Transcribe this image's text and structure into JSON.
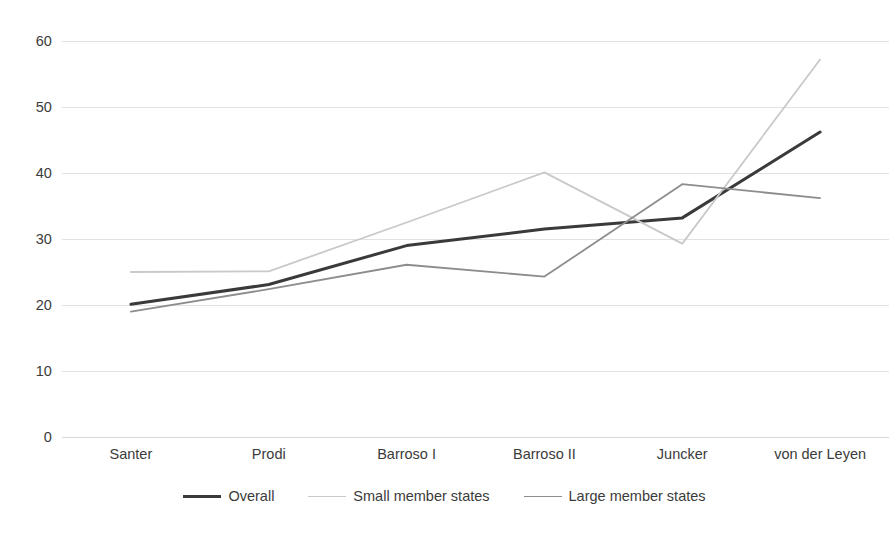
{
  "chart_data": {
    "type": "line",
    "title": "",
    "subtitle": "",
    "xlabel": "",
    "ylabel": "",
    "categories": [
      "Santer",
      "Prodi",
      "Barroso I",
      "Barroso II",
      "Juncker",
      "von der Leyen"
    ],
    "series": [
      {
        "name": "Overall",
        "color": "#3a3a3a",
        "width": 3.0,
        "values": [
          20.1,
          23.1,
          29.0,
          31.5,
          33.2,
          46.2
        ]
      },
      {
        "name": "Small member states",
        "color": "#c9c9c9",
        "width": 1.8,
        "values": [
          25.0,
          25.1,
          32.5,
          40.1,
          29.3,
          57.2
        ]
      },
      {
        "name": "Large member states",
        "color": "#8d8d8d",
        "width": 1.8,
        "values": [
          19.0,
          22.4,
          26.1,
          24.3,
          38.3,
          36.2
        ]
      }
    ],
    "ylim": [
      0,
      60
    ],
    "yticks": [
      0,
      10,
      20,
      30,
      40,
      50,
      60
    ],
    "ytick_labels": [
      "0",
      "10",
      "20",
      "30",
      "40",
      "50",
      "60"
    ],
    "grid": true,
    "grid_color": "#e2e2e2",
    "legend_position": "bottom",
    "background": "#ffffff"
  },
  "legend": {
    "items": [
      {
        "label": "Overall"
      },
      {
        "label": "Small member states"
      },
      {
        "label": "Large member states"
      }
    ]
  }
}
